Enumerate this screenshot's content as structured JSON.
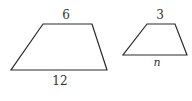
{
  "figure": {
    "stroke_color": "#2a2a2a",
    "trapezoids": [
      {
        "name": "large",
        "top_label": "6",
        "bottom_label": "12",
        "points": "43,24 92,24 107,70 11,70"
      },
      {
        "name": "small",
        "top_label": "3",
        "bottom_label": "n",
        "points": "147,24 175,24 187,55 123,55"
      }
    ]
  }
}
